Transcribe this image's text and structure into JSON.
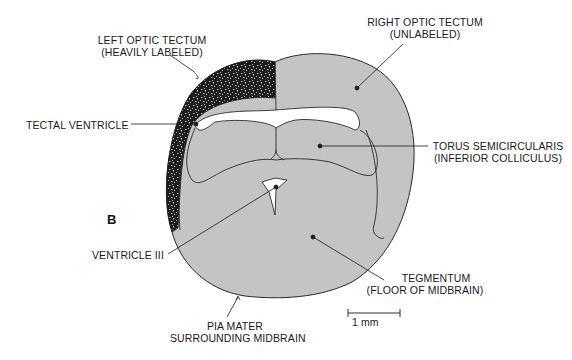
{
  "figure": {
    "panel_letter": "B",
    "labels": {
      "left_tectum": {
        "line1": "LEFT OPTIC TECTUM",
        "line2": "(HEAVILY LABELED)"
      },
      "right_tectum": {
        "line1": "RIGHT OPTIC TECTUM",
        "line2": "(UNLABELED)"
      },
      "tectal_ventricle": {
        "line1": "TECTAL VENTRICLE"
      },
      "torus": {
        "line1": "TORUS SEMICIRCULARIS",
        "line2": "(INFERIOR COLLICULUS)"
      },
      "ventricle_iii": {
        "line1": "VENTRICLE III"
      },
      "tegmentum": {
        "line1": "TEGMENTUM",
        "line2": "(FLOOR OF MIDBRAIN)"
      },
      "pia_mater": {
        "line1": "PIA MATER",
        "line2": "SURROUNDING MIDBRAIN"
      }
    },
    "scale_bar": {
      "label": "1 mm"
    },
    "colors": {
      "tissue": "#c4c4c4",
      "labeled": "#1c1c1c",
      "outline": "#2a2a2a",
      "ventricle": "#ffffff"
    }
  }
}
